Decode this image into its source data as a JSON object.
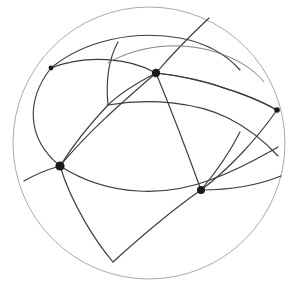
{
  "figure": {
    "type": "diagram",
    "canvas": {
      "width": 301,
      "height": 289
    },
    "background_color": "#ffffff",
    "colors": {
      "boundary": "#a9a9a9",
      "arc": "#3a3a42",
      "arc_light": "#6e6e78",
      "vertex": "#1a1a1a"
    },
    "stroke_widths": {
      "boundary": 1.0,
      "arc": 1.15,
      "arc_light": 0.9
    },
    "boundary": {
      "name": "outer-sphere-outline",
      "cx": 149,
      "cy": 143,
      "r": 136
    },
    "vertices": [
      {
        "id": "v-top",
        "label": "top vertex",
        "cx": 156,
        "cy": 73,
        "r": 4.2
      },
      {
        "id": "v-upper-left",
        "label": "upper left vertex",
        "cx": 51,
        "cy": 68,
        "r": 2.4
      },
      {
        "id": "v-left",
        "label": "left vertex",
        "cx": 60,
        "cy": 166,
        "r": 4.6
      },
      {
        "id": "v-right",
        "label": "right vertex",
        "cx": 277,
        "cy": 110,
        "r": 2.8
      },
      {
        "id": "v-lower-right",
        "label": "lower right vertex",
        "cx": 201,
        "cy": 190,
        "r": 4.0
      }
    ],
    "arcs": [
      {
        "id": "a01",
        "name": "arc-upperleft-to-top",
        "d": "M 51 68 C 86 54, 130 58, 156 73",
        "shade": "dark"
      },
      {
        "id": "a02",
        "name": "arc-top-to-right",
        "d": "M 156 73 C 198 78, 244 92, 277 110",
        "shade": "dark"
      },
      {
        "id": "a03",
        "name": "arc-top-to-left",
        "d": "M 156 73 C 120 104, 86 134, 60 166",
        "shade": "dark"
      },
      {
        "id": "a04",
        "name": "arc-top-up-right-boundary",
        "d": "M 156 73 C 174 52, 192 34, 209 18",
        "shade": "dark"
      },
      {
        "id": "a05",
        "name": "arc-top-to-lowerright",
        "d": "M 156 73 C 172 112, 188 154, 201 190",
        "shade": "dark"
      },
      {
        "id": "a06",
        "name": "arc-top-crossbar-left",
        "d": "M 156 73 C 135 84, 118 95, 108 105",
        "shade": "dark"
      },
      {
        "id": "a07",
        "name": "arc-upperleft-crest-right",
        "d": "M 51 68 C 85 40, 135 30, 180 38 C 206 43, 226 54, 240 70",
        "shade": "dark"
      },
      {
        "id": "a08",
        "name": "arc-upperleft-down-to-left",
        "d": "M 51 68 C 26 100, 26 138, 60 166",
        "shade": "dark"
      },
      {
        "id": "a09",
        "name": "arc-junction-vertical-up",
        "d": "M 108 105 C 106 84, 108 60, 118 42",
        "shade": "dark"
      },
      {
        "id": "a10",
        "name": "arc-junction-to-left-vertex",
        "d": "M 108 105 C 89 125, 72 147, 60 166",
        "shade": "dark"
      },
      {
        "id": "a11",
        "name": "arc-junction-sweep-right",
        "d": "M 108 105 C 150 98, 196 102, 228 118 C 252 130, 268 145, 278 156",
        "shade": "dark"
      },
      {
        "id": "a12",
        "name": "arc-right-vertex-to-junction",
        "d": "M 277 110 C 256 98, 238 92, 224 88",
        "shade": "dark"
      },
      {
        "id": "a13",
        "name": "arc-right-vertex-down-left",
        "d": "M 277 110 C 256 140, 228 170, 201 190",
        "shade": "dark"
      },
      {
        "id": "a14",
        "name": "arc-left-vertex-sweep-right",
        "d": "M 60 166 C 110 198, 168 196, 210 180 C 240 169, 262 156, 278 147",
        "shade": "dark"
      },
      {
        "id": "a15",
        "name": "arc-left-vertex-short-west",
        "d": "M 60 166 C 46 170, 34 175, 24 181",
        "shade": "dark"
      },
      {
        "id": "a16",
        "name": "arc-left-vertex-to-cusp",
        "d": "M 60 166 C 72 205, 96 242, 113 262",
        "shade": "dark"
      },
      {
        "id": "a17",
        "name": "arc-cusp-to-lowerright",
        "d": "M 113 262 C 146 232, 178 206, 201 190",
        "shade": "dark"
      },
      {
        "id": "a18",
        "name": "arc-lowerright-east-sweep",
        "d": "M 201 190 C 228 190, 256 186, 281 176",
        "shade": "dark"
      },
      {
        "id": "a19",
        "name": "arc-lowerright-up-right",
        "d": "M 201 190 C 216 172, 230 152, 240 132",
        "shade": "dark"
      },
      {
        "id": "a20",
        "name": "arc-junction-upper-to-rightvertex",
        "d": "M 224 88 C 204 80, 182 76, 156 73",
        "shade": "dark"
      },
      {
        "id": "a21",
        "name": "arc-inner-top-crest",
        "d": "M 108 63 C 140 44, 186 40, 224 55 C 243 62, 256 72, 264 82",
        "shade": "light"
      }
    ],
    "annotations": {
      "vertex_count": 5,
      "arc_count": 21,
      "shape": "circle"
    }
  }
}
